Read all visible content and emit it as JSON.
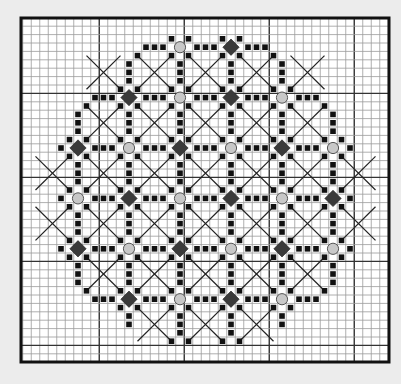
{
  "colors": {
    "background": "#ececec",
    "grid_fill": "#ffffff",
    "grid_line": "#9a9a9a",
    "grid_line_major": "#333333",
    "border": "#111111",
    "square": "#111111",
    "diamond": "#3a3a3a",
    "circle_fill": "#c8c8c8",
    "circle_stroke": "#555555",
    "cross": "#222222"
  },
  "grid": {
    "columns": 43,
    "rows": 41,
    "major_every": 10,
    "major_col_offset": 9,
    "major_row_offset": 9
  },
  "legend": {
    "square": "stitch (black square)",
    "diamond": "dark diamond motif",
    "circle": "grey bead / circle motif",
    "cross": "straight stitch cross (X)"
  },
  "motifs": [
    {
      "c": 18,
      "r": 3,
      "type": "circle"
    },
    {
      "c": 24,
      "r": 3,
      "type": "diamond"
    },
    {
      "c": 12,
      "r": 9,
      "type": "diamond"
    },
    {
      "c": 18,
      "r": 9,
      "type": "circle"
    },
    {
      "c": 24,
      "r": 9,
      "type": "diamond"
    },
    {
      "c": 30,
      "r": 9,
      "type": "circle"
    },
    {
      "c": 6,
      "r": 15,
      "type": "diamond"
    },
    {
      "c": 12,
      "r": 15,
      "type": "circle"
    },
    {
      "c": 18,
      "r": 15,
      "type": "diamond"
    },
    {
      "c": 24,
      "r": 15,
      "type": "circle"
    },
    {
      "c": 30,
      "r": 15,
      "type": "diamond"
    },
    {
      "c": 36,
      "r": 15,
      "type": "circle"
    },
    {
      "c": 6,
      "r": 21,
      "type": "circle"
    },
    {
      "c": 12,
      "r": 21,
      "type": "diamond"
    },
    {
      "c": 18,
      "r": 21,
      "type": "circle"
    },
    {
      "c": 24,
      "r": 21,
      "type": "diamond"
    },
    {
      "c": 30,
      "r": 21,
      "type": "circle"
    },
    {
      "c": 36,
      "r": 21,
      "type": "diamond"
    },
    {
      "c": 6,
      "r": 27,
      "type": "diamond"
    },
    {
      "c": 12,
      "r": 27,
      "type": "circle"
    },
    {
      "c": 18,
      "r": 27,
      "type": "diamond"
    },
    {
      "c": 24,
      "r": 27,
      "type": "circle"
    },
    {
      "c": 30,
      "r": 27,
      "type": "diamond"
    },
    {
      "c": 36,
      "r": 27,
      "type": "circle"
    },
    {
      "c": 12,
      "r": 33,
      "type": "diamond"
    },
    {
      "c": 18,
      "r": 33,
      "type": "circle"
    },
    {
      "c": 24,
      "r": 33,
      "type": "diamond"
    },
    {
      "c": 30,
      "r": 33,
      "type": "circle"
    }
  ],
  "horizontal_arms": [
    {
      "c": 14,
      "r": 3,
      "n": 3
    },
    {
      "c": 20,
      "r": 3,
      "n": 3
    },
    {
      "c": 26,
      "r": 3,
      "n": 3
    },
    {
      "c": 8,
      "r": 9,
      "n": 3
    },
    {
      "c": 14,
      "r": 9,
      "n": 3
    },
    {
      "c": 20,
      "r": 9,
      "n": 3
    },
    {
      "c": 26,
      "r": 9,
      "n": 3
    },
    {
      "c": 32,
      "r": 9,
      "n": 3
    },
    {
      "c": 4,
      "r": 15,
      "n": 1
    },
    {
      "c": 8,
      "r": 15,
      "n": 3
    },
    {
      "c": 14,
      "r": 15,
      "n": 3
    },
    {
      "c": 20,
      "r": 15,
      "n": 3
    },
    {
      "c": 26,
      "r": 15,
      "n": 3
    },
    {
      "c": 32,
      "r": 15,
      "n": 3
    },
    {
      "c": 38,
      "r": 15,
      "n": 1
    },
    {
      "c": 4,
      "r": 21,
      "n": 1
    },
    {
      "c": 8,
      "r": 21,
      "n": 3
    },
    {
      "c": 14,
      "r": 21,
      "n": 3
    },
    {
      "c": 20,
      "r": 21,
      "n": 3
    },
    {
      "c": 26,
      "r": 21,
      "n": 3
    },
    {
      "c": 32,
      "r": 21,
      "n": 3
    },
    {
      "c": 38,
      "r": 21,
      "n": 1
    },
    {
      "c": 4,
      "r": 27,
      "n": 1
    },
    {
      "c": 8,
      "r": 27,
      "n": 3
    },
    {
      "c": 14,
      "r": 27,
      "n": 3
    },
    {
      "c": 20,
      "r": 27,
      "n": 3
    },
    {
      "c": 26,
      "r": 27,
      "n": 3
    },
    {
      "c": 32,
      "r": 27,
      "n": 3
    },
    {
      "c": 38,
      "r": 27,
      "n": 1
    },
    {
      "c": 8,
      "r": 33,
      "n": 3
    },
    {
      "c": 14,
      "r": 33,
      "n": 3
    },
    {
      "c": 20,
      "r": 33,
      "n": 3
    },
    {
      "c": 26,
      "r": 33,
      "n": 3
    },
    {
      "c": 32,
      "r": 33,
      "n": 3
    }
  ],
  "vertical_arms": [
    {
      "c": 12,
      "r": 5,
      "n": 3
    },
    {
      "c": 12,
      "r": 11,
      "n": 3
    },
    {
      "c": 12,
      "r": 17,
      "n": 3
    },
    {
      "c": 12,
      "r": 23,
      "n": 3
    },
    {
      "c": 12,
      "r": 29,
      "n": 3
    },
    {
      "c": 12,
      "r": 35,
      "n": 2
    },
    {
      "c": 18,
      "r": 5,
      "n": 3
    },
    {
      "c": 18,
      "r": 11,
      "n": 3
    },
    {
      "c": 18,
      "r": 17,
      "n": 3
    },
    {
      "c": 18,
      "r": 23,
      "n": 3
    },
    {
      "c": 18,
      "r": 29,
      "n": 3
    },
    {
      "c": 18,
      "r": 35,
      "n": 3
    },
    {
      "c": 24,
      "r": 5,
      "n": 3
    },
    {
      "c": 24,
      "r": 11,
      "n": 3
    },
    {
      "c": 24,
      "r": 17,
      "n": 3
    },
    {
      "c": 24,
      "r": 23,
      "n": 3
    },
    {
      "c": 24,
      "r": 29,
      "n": 3
    },
    {
      "c": 24,
      "r": 35,
      "n": 3
    },
    {
      "c": 30,
      "r": 5,
      "n": 3
    },
    {
      "c": 30,
      "r": 11,
      "n": 3
    },
    {
      "c": 30,
      "r": 17,
      "n": 3
    },
    {
      "c": 30,
      "r": 23,
      "n": 3
    },
    {
      "c": 30,
      "r": 29,
      "n": 3
    },
    {
      "c": 30,
      "r": 35,
      "n": 2
    },
    {
      "c": 6,
      "r": 11,
      "n": 3
    },
    {
      "c": 6,
      "r": 17,
      "n": 3
    },
    {
      "c": 6,
      "r": 23,
      "n": 3
    },
    {
      "c": 6,
      "r": 29,
      "n": 3
    },
    {
      "c": 36,
      "r": 11,
      "n": 3
    },
    {
      "c": 36,
      "r": 17,
      "n": 3
    },
    {
      "c": 36,
      "r": 23,
      "n": 3
    },
    {
      "c": 36,
      "r": 29,
      "n": 3
    }
  ],
  "extra_squares": [
    {
      "c": 13,
      "r": 4
    },
    {
      "c": 29,
      "r": 4
    },
    {
      "c": 7,
      "r": 10
    },
    {
      "c": 35,
      "r": 10
    },
    {
      "c": 7,
      "r": 32
    },
    {
      "c": 35,
      "r": 32
    },
    {
      "c": 17,
      "r": 38
    },
    {
      "c": 19,
      "r": 38
    },
    {
      "c": 23,
      "r": 38
    },
    {
      "c": 25,
      "r": 38
    }
  ],
  "crosses": [
    {
      "c": 9,
      "r": 6
    },
    {
      "c": 15,
      "r": 6
    },
    {
      "c": 21,
      "r": 6
    },
    {
      "c": 27,
      "r": 6
    },
    {
      "c": 33,
      "r": 6
    },
    {
      "c": 9,
      "r": 12
    },
    {
      "c": 15,
      "r": 12
    },
    {
      "c": 21,
      "r": 12
    },
    {
      "c": 27,
      "r": 12
    },
    {
      "c": 33,
      "r": 12
    },
    {
      "c": 3,
      "r": 18
    },
    {
      "c": 9,
      "r": 18
    },
    {
      "c": 15,
      "r": 18
    },
    {
      "c": 21,
      "r": 18
    },
    {
      "c": 27,
      "r": 18
    },
    {
      "c": 33,
      "r": 18
    },
    {
      "c": 39,
      "r": 18
    },
    {
      "c": 3,
      "r": 24
    },
    {
      "c": 9,
      "r": 24
    },
    {
      "c": 15,
      "r": 24
    },
    {
      "c": 21,
      "r": 24
    },
    {
      "c": 27,
      "r": 24
    },
    {
      "c": 33,
      "r": 24
    },
    {
      "c": 39,
      "r": 24
    },
    {
      "c": 9,
      "r": 30
    },
    {
      "c": 15,
      "r": 30
    },
    {
      "c": 21,
      "r": 30
    },
    {
      "c": 27,
      "r": 30
    },
    {
      "c": 33,
      "r": 30
    },
    {
      "c": 15,
      "r": 36
    },
    {
      "c": 21,
      "r": 36
    },
    {
      "c": 27,
      "r": 36
    }
  ]
}
